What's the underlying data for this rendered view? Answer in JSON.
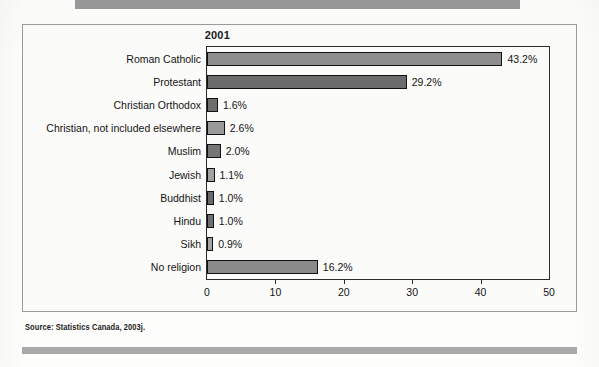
{
  "page": {
    "running_header": "",
    "source_note": "Source: Statistics Canada, 2003j."
  },
  "chart_data": {
    "type": "bar",
    "orientation": "horizontal",
    "title": "2001",
    "xlabel": "",
    "ylabel": "",
    "xlim": [
      0,
      50
    ],
    "xticks": [
      0,
      10,
      20,
      30,
      40,
      50
    ],
    "xtick_labels": [
      "0",
      "10",
      "20",
      "30",
      "40",
      "50"
    ],
    "grid": false,
    "legend": null,
    "categories": [
      "Roman Catholic",
      "Protestant",
      "Christian Orthodox",
      "Christian, not included elsewhere",
      "Muslim",
      "Jewish",
      "Buddhist",
      "Hindu",
      "Sikh",
      "No religion"
    ],
    "values": [
      43.2,
      29.2,
      1.6,
      2.6,
      2.0,
      1.1,
      1.0,
      1.0,
      0.9,
      16.2
    ],
    "data_labels": [
      "43.2%",
      "29.2%",
      "1.6%",
      "2.6%",
      "2.0%",
      "1.1%",
      "1.0%",
      "1.0%",
      "0.9%",
      "16.2%"
    ],
    "bar_colors": [
      "#8e8e8e",
      "#6b6b6b",
      "#6e6e6e",
      "#9a9a9a",
      "#757575",
      "#a2a2a2",
      "#6a6a6a",
      "#6f6f6f",
      "#a4a4a4",
      "#8a8a8a"
    ],
    "bar_edge_color": "#111111"
  }
}
